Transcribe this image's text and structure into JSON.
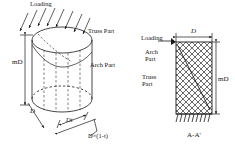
{
  "figure": {
    "caption": "A-A'",
    "stroke_color": "#1a1a1a",
    "hatch_color": "#555555"
  },
  "view_3d": {
    "name": "cylindrical-shell-3d-view",
    "labels": {
      "loading": "Loading",
      "truss_part": "Truss Part",
      "arch_part": "Arch Part",
      "height": "mD",
      "diameter": "D",
      "segment_top": "Dt",
      "segment_bottom": "D×(1-t)"
    }
  },
  "view_section": {
    "name": "section-a-a-view",
    "labels": {
      "loading": "Loading",
      "arch_part_line1": "Arch",
      "arch_part_line2": "Part",
      "truss_part_line1": "Truss",
      "truss_part_line2": "Part",
      "width": "D",
      "height": "mD",
      "caption": "A-A'"
    }
  }
}
